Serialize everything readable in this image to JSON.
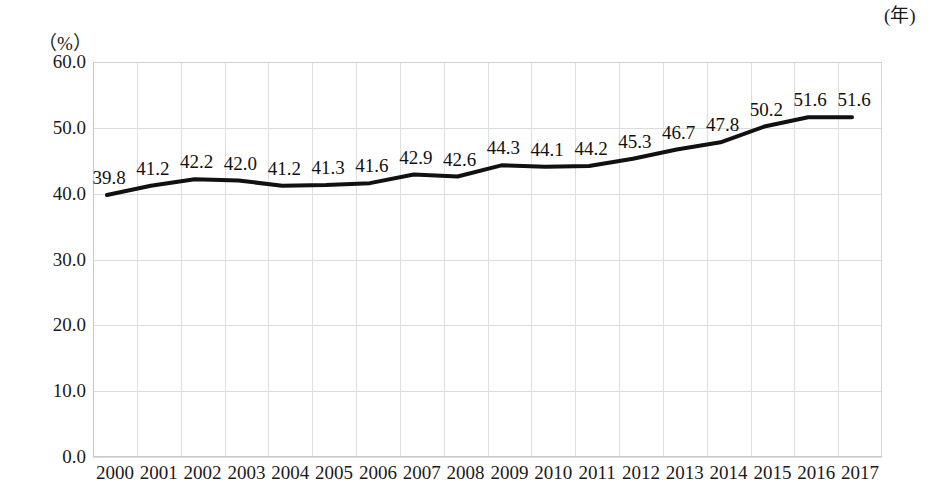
{
  "chart_data": {
    "type": "line",
    "title": "",
    "xlabel": "年",
    "ylabel": "%",
    "unit_label": "（%）",
    "xaxis_unit_label": "(年)",
    "categories": [
      "2000",
      "2001",
      "2002",
      "2003",
      "2004",
      "2005",
      "2006",
      "2007",
      "2008",
      "2009",
      "2010",
      "2011",
      "2012",
      "2013",
      "2014",
      "2015",
      "2016",
      "2017"
    ],
    "values": [
      39.8,
      41.2,
      42.2,
      42.0,
      41.2,
      41.3,
      41.6,
      42.9,
      42.6,
      44.3,
      44.1,
      44.2,
      45.3,
      46.7,
      47.8,
      50.2,
      51.6,
      51.6
    ],
    "data_labels": [
      "39.8",
      "41.2",
      "42.2",
      "42.0",
      "41.2",
      "41.3",
      "41.6",
      "42.9",
      "42.6",
      "44.3",
      "44.1",
      "44.2",
      "45.3",
      "46.7",
      "47.8",
      "50.2",
      "51.6",
      "51.6"
    ],
    "ylim": [
      0.0,
      60.0
    ],
    "ytick_values": [
      60.0,
      50.0,
      40.0,
      30.0,
      20.0,
      10.0,
      0.0
    ],
    "ytick_labels": [
      "60.0",
      "50.0",
      "40.0",
      "30.0",
      "20.0",
      "10.0",
      "0.0"
    ],
    "grid": true,
    "grid_color": "#dcdcdc",
    "legend": null,
    "legend_position": "none",
    "line_color": "#111111",
    "line_width": 4,
    "series": [
      {
        "name": "",
        "values": [
          39.8,
          41.2,
          42.2,
          42.0,
          41.2,
          41.3,
          41.6,
          42.9,
          42.6,
          44.3,
          44.1,
          44.2,
          45.3,
          46.7,
          47.8,
          50.2,
          51.6,
          51.6
        ]
      }
    ]
  }
}
